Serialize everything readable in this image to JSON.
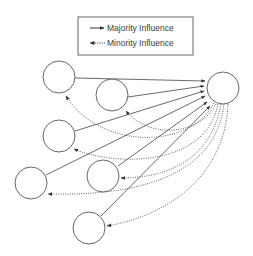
{
  "legend": {
    "items": [
      {
        "label": "Majority Influence",
        "style": "solid",
        "arrow": "right"
      },
      {
        "label": "Minority Influence",
        "style": "dotted",
        "arrow": "left"
      }
    ]
  },
  "colors": {
    "stroke": "#444444",
    "dotted": "#555555",
    "border": "#666666",
    "background": "#ffffff"
  },
  "nodes": [
    {
      "id": "A",
      "cx": 59,
      "cy": 77,
      "r": 16
    },
    {
      "id": "B",
      "cx": 112,
      "cy": 95,
      "r": 16
    },
    {
      "id": "C",
      "cx": 59,
      "cy": 136,
      "r": 16
    },
    {
      "id": "D",
      "cx": 31,
      "cy": 183,
      "r": 16
    },
    {
      "id": "E",
      "cx": 103,
      "cy": 176,
      "r": 16
    },
    {
      "id": "F",
      "cx": 89,
      "cy": 228,
      "r": 16
    },
    {
      "id": "G",
      "cx": 223,
      "cy": 88,
      "r": 16,
      "role": "target"
    }
  ],
  "edges": [
    {
      "from": "A",
      "to": "G",
      "type": "majority"
    },
    {
      "from": "B",
      "to": "G",
      "type": "majority"
    },
    {
      "from": "C",
      "to": "G",
      "type": "majority"
    },
    {
      "from": "D",
      "to": "G",
      "type": "majority"
    },
    {
      "from": "E",
      "to": "G",
      "type": "majority"
    },
    {
      "from": "F",
      "to": "G",
      "type": "majority"
    },
    {
      "from": "G",
      "to": "A",
      "type": "minority"
    },
    {
      "from": "G",
      "to": "B",
      "type": "minority"
    },
    {
      "from": "G",
      "to": "C",
      "type": "minority"
    },
    {
      "from": "G",
      "to": "D",
      "type": "minority"
    },
    {
      "from": "G",
      "to": "E",
      "type": "minority"
    },
    {
      "from": "G",
      "to": "F",
      "type": "minority"
    }
  ]
}
